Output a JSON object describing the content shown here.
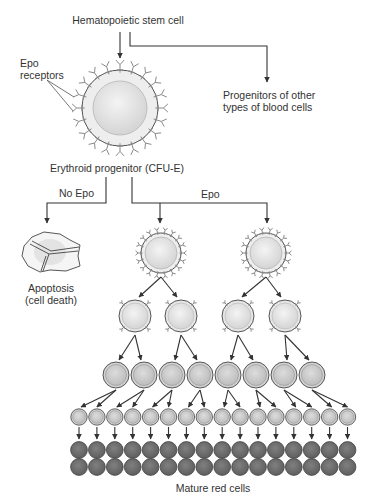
{
  "diagram": {
    "labels": {
      "stem_cell": "Hematopoietic stem cell",
      "epo_receptors_line1": "Epo",
      "epo_receptors_line2": "receptors",
      "other_progenitors_line1": "Progenitors of other",
      "other_progenitors_line2": "types of blood cells",
      "erythroid_progenitor": "Erythroid progenitor (CFU-E)",
      "no_epo": "No Epo",
      "epo": "Epo",
      "apoptosis_line1": "Apoptosis",
      "apoptosis_line2": "(cell death)",
      "mature_red_cells": "Mature red cells"
    },
    "stages": [
      {
        "name": "erythroid-progenitor",
        "count": 1,
        "has_epo_receptors": true
      },
      {
        "name": "division-1",
        "count": 2,
        "has_epo_receptors": true
      },
      {
        "name": "division-2",
        "count": 4,
        "has_epo_receptors": true
      },
      {
        "name": "division-3",
        "count": 8,
        "has_epo_receptors": false
      },
      {
        "name": "division-4",
        "count": 16,
        "has_epo_receptors": false
      },
      {
        "name": "mature-red-cells",
        "count": 32,
        "has_epo_receptors": false
      }
    ],
    "colors": {
      "line": "#333333",
      "cell_fill": "#ececec",
      "nucleus_fill": "#dedede",
      "receptor": "#8a8a8a",
      "mature_cell": "#6f6f6f"
    }
  }
}
